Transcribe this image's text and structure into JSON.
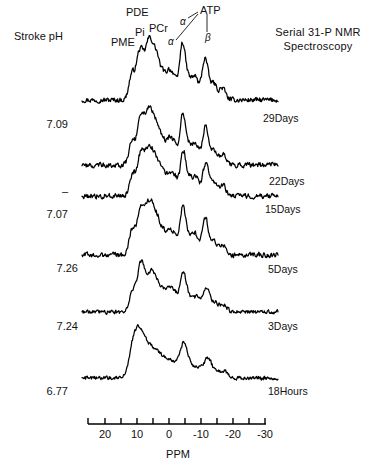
{
  "figure": {
    "title_line1": "Serial 31-P NMR",
    "title_line2": "Spectroscopy",
    "left_header": "Stroke pH",
    "axis_label": "PPM"
  },
  "peak_labels": [
    {
      "name": "PME",
      "text": "PME",
      "x": 111,
      "y": 36
    },
    {
      "name": "Pi",
      "text": "Pi",
      "x": 135,
      "y": 26
    },
    {
      "name": "PDE",
      "text": "PDE",
      "x": 126,
      "y": 6
    },
    {
      "name": "PCr",
      "text": "PCr",
      "x": 149,
      "y": 22
    },
    {
      "name": "ATP",
      "text": "ATP",
      "x": 200,
      "y": 4
    },
    {
      "name": "alpha-1",
      "text": "α",
      "x": 180,
      "y": 16
    },
    {
      "name": "alpha-2",
      "text": "α",
      "x": 168,
      "y": 36
    },
    {
      "name": "beta",
      "text": "β",
      "x": 205,
      "y": 32
    }
  ],
  "traces": [
    {
      "ph": "7.09",
      "time": "29Days",
      "ph_y": 118,
      "time_y": 112
    },
    {
      "ph": "–",
      "time": "22Days",
      "ph_y": 185,
      "time_y": 175
    },
    {
      "ph": "7.07",
      "time": "15Days",
      "ph_y": 208,
      "time_y": 203
    },
    {
      "ph": "7.26",
      "time": "5Days",
      "ph_y": 262,
      "time_y": 263
    },
    {
      "ph": "7.24",
      "time": "3Days",
      "ph_y": 320,
      "time_y": 320
    },
    {
      "ph": "6.77",
      "time": "18Hours",
      "ph_y": 385,
      "time_y": 385
    }
  ],
  "chart_data": {
    "type": "line",
    "title": "Serial 31-P NMR Spectroscopy",
    "xlabel": "PPM",
    "ylabel": "",
    "xlim": [
      25,
      -35
    ],
    "grid": false,
    "legend": "right-of-trace",
    "axis_ticks_major": [
      20,
      10,
      0,
      -10,
      -20,
      -30
    ],
    "axis_tick_labels": [
      "20",
      "10",
      "0",
      "-10",
      "-20",
      "-30"
    ],
    "axis_ticks_minor": [
      15,
      5,
      -5,
      -15,
      -25
    ],
    "peak_assignments": [
      "PME",
      "Pi",
      "PDE",
      "PCr",
      "ATP α",
      "ATP α",
      "ATP β"
    ],
    "series": [
      {
        "name": "29Days",
        "ph": 7.09,
        "baseline_y": 100
      },
      {
        "name": "22Days",
        "ph": null,
        "baseline_y": 165
      },
      {
        "name": "15Days",
        "ph": 7.07,
        "baseline_y": 196
      },
      {
        "name": "5Days",
        "ph": 7.26,
        "baseline_y": 255
      },
      {
        "name": "3Days",
        "ph": 7.24,
        "baseline_y": 312
      },
      {
        "name": "18Hours",
        "ph": 6.77,
        "baseline_y": 378
      }
    ],
    "ph_values": [
      7.09,
      null,
      7.07,
      7.26,
      7.24,
      6.77
    ],
    "time_points": [
      "29Days",
      "22Days",
      "15Days",
      "5Days",
      "3Days",
      "18Hours"
    ]
  }
}
